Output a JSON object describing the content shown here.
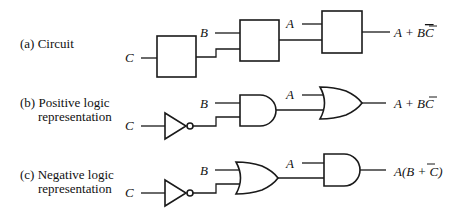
{
  "rows": [
    {
      "id": "a",
      "caption_line1": "(a) Circuit",
      "caption_line2": "",
      "input_c": "C",
      "input_b": "B",
      "input_a": "A",
      "output_main": "A + B",
      "output_overbar": "C",
      "output_tail": ""
    },
    {
      "id": "b",
      "caption_line1": "(b) Positive logic",
      "caption_line2": "representation",
      "input_c": "C",
      "input_b": "B",
      "input_a": "A",
      "output_main": "A + B",
      "output_overbar": "C",
      "output_tail": ""
    },
    {
      "id": "c",
      "caption_line1": "(c) Negative logic",
      "caption_line2": "representation",
      "input_c": "C",
      "input_b": "B",
      "input_a": "A",
      "output_main": "A(B + ",
      "output_overbar": "C",
      "output_tail": ")"
    }
  ],
  "colors": {
    "ink": "#1a1a1a",
    "background": "#ffffff"
  }
}
